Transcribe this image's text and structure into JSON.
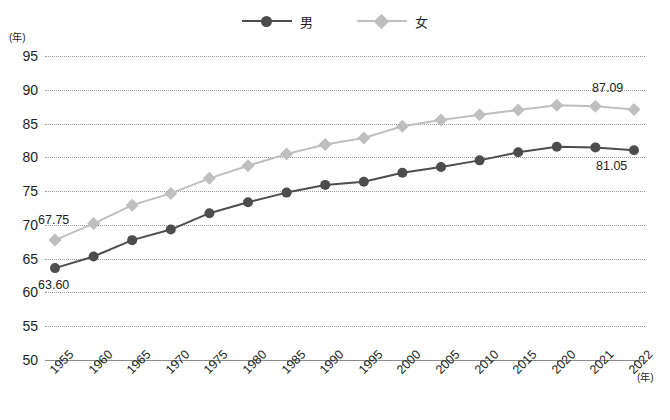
{
  "legend": {
    "position": "top-center",
    "entries": [
      {
        "label": "男",
        "color": "#4d4d4d",
        "marker": "circle"
      },
      {
        "label": "女",
        "color": "#bfbfbf",
        "marker": "diamond"
      }
    ]
  },
  "axes": {
    "y_unit": "(年)",
    "x_unit": "(年)"
  },
  "point_labels": {
    "male_first": "63.60",
    "male_last": "81.05",
    "female_first": "67.75",
    "female_last": "87.09"
  },
  "chart_data": {
    "type": "line",
    "title": "",
    "xlabel": "(年)",
    "ylabel": "(年)",
    "ylim": [
      50,
      95
    ],
    "ytick_step": 5,
    "yticks": [
      50,
      55,
      60,
      65,
      70,
      75,
      80,
      85,
      90,
      95
    ],
    "grid": true,
    "legend_position": "top-center",
    "categories": [
      "1955",
      "1960",
      "1965",
      "1970",
      "1975",
      "1980",
      "1985",
      "1990",
      "1995",
      "2000",
      "2005",
      "2010",
      "2015",
      "2020",
      "2021",
      "2022"
    ],
    "series": [
      {
        "name": "男",
        "color": "#4d4d4d",
        "marker": "circle",
        "values": [
          63.6,
          65.32,
          67.74,
          69.31,
          71.73,
          73.35,
          74.78,
          75.92,
          76.38,
          77.72,
          78.56,
          79.55,
          80.75,
          81.56,
          81.47,
          81.05
        ]
      },
      {
        "name": "女",
        "color": "#bfbfbf",
        "marker": "diamond",
        "values": [
          67.75,
          70.19,
          72.92,
          74.66,
          76.89,
          78.76,
          80.48,
          81.9,
          82.85,
          84.6,
          85.52,
          86.3,
          86.99,
          87.71,
          87.57,
          87.09
        ]
      }
    ]
  }
}
